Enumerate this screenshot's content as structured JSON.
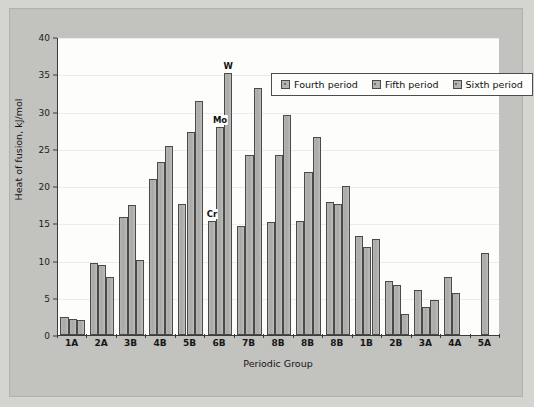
{
  "chart_data": {
    "type": "bar",
    "title": "",
    "xlabel": "Periodic Group",
    "ylabel": "Heat of fusion, kJ/mol",
    "ylim": [
      0,
      40
    ],
    "ytick_step": 5,
    "yticks": [
      "0",
      "5",
      "10",
      "15",
      "20",
      "25",
      "30",
      "35",
      "40"
    ],
    "grid": true,
    "legend_position": "upper-right",
    "categories": [
      "1A",
      "2A",
      "3B",
      "4B",
      "5B",
      "6B",
      "7B",
      "8B",
      "8B",
      "8B",
      "1B",
      "2B",
      "3A",
      "4A",
      "5A"
    ],
    "series": [
      {
        "name": "Fourth period",
        "values": [
          2.4,
          9.6,
          15.9,
          21.0,
          17.6,
          15.3,
          14.7,
          15.2,
          15.3,
          17.8,
          13.3,
          7.2,
          6.1,
          7.8,
          null
        ]
      },
      {
        "name": "Fifth period",
        "values": [
          2.2,
          9.4,
          17.4,
          23.2,
          27.3,
          27.9,
          24.1,
          24.1,
          21.9,
          17.6,
          11.8,
          6.7,
          3.7,
          5.6,
          11.0
        ]
      },
      {
        "name": "Sixth period",
        "values": [
          2.0,
          7.8,
          10.1,
          25.4,
          31.4,
          35.2,
          33.1,
          29.5,
          26.6,
          20.0,
          12.9,
          2.8,
          4.7,
          null,
          null
        ]
      }
    ],
    "annotations": [
      {
        "text": "Cr",
        "category_index": 5,
        "series_index": 0,
        "value": 15.3
      },
      {
        "text": "Mo",
        "category_index": 5,
        "series_index": 1,
        "value": 27.9
      },
      {
        "text": "W",
        "category_index": 5,
        "series_index": 2,
        "value": 35.2
      }
    ],
    "colors": {
      "bar_fill": "#b1b1ad",
      "bar_border": "#4a4a4a",
      "plot_background": "#fdfdfb",
      "figure_background": "#c2c2be",
      "gridline": "#ececec",
      "axis": "#3b3b3b",
      "text": "#141414"
    }
  },
  "legend": {
    "items": [
      {
        "label": "Fourth period"
      },
      {
        "label": "Fifth period"
      },
      {
        "label": "Sixth period"
      }
    ]
  }
}
